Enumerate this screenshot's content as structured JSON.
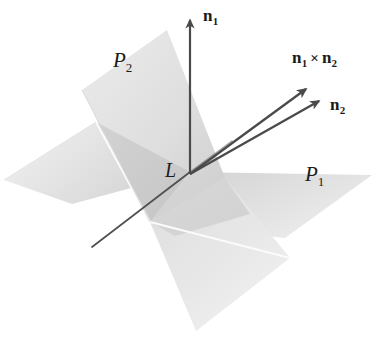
{
  "figure": {
    "kind": "geometry-diagram",
    "background_color": "#ffffff",
    "labels": {
      "n1": {
        "base": "n",
        "sub": "1"
      },
      "n2": {
        "base": "n",
        "sub": "2"
      },
      "cross": {
        "left_base": "n",
        "left_sub": "1",
        "operator": "×",
        "right_base": "n",
        "right_sub": "2"
      },
      "p1": {
        "base": "P",
        "sub": "1"
      },
      "p2": {
        "base": "P",
        "sub": "2"
      },
      "line": "L"
    },
    "colors": {
      "plane_p1_light": "#e9e9e9",
      "plane_p1_mid": "#dcdcdc",
      "plane_p2_light": "#e4e4e4",
      "plane_p2_mid": "#d2d2d2",
      "overlap_dark": "#c9c9c9",
      "edge_stroke": "#8e8e8e",
      "highlight_stroke": "#fbfbfb",
      "arrow_stroke": "#4a4a4a",
      "line_stroke": "#4f4f4f",
      "text": "#1a1a1a"
    },
    "geometry": {
      "intersection_point": {
        "x": 190,
        "y": 172
      },
      "arrows": [
        {
          "name": "n1",
          "from": {
            "x": 190,
            "y": 174
          },
          "to": {
            "x": 190,
            "y": 16
          }
        },
        {
          "name": "n1-cross-n2",
          "from": {
            "x": 190,
            "y": 174
          },
          "to": {
            "x": 309,
            "y": 86
          }
        },
        {
          "name": "n2",
          "from": {
            "x": 190,
            "y": 174
          },
          "to": {
            "x": 322,
            "y": 99
          }
        }
      ],
      "line_L": {
        "from": {
          "x": 190,
          "y": 172
        },
        "to": {
          "x": 92,
          "y": 247
        }
      }
    }
  }
}
